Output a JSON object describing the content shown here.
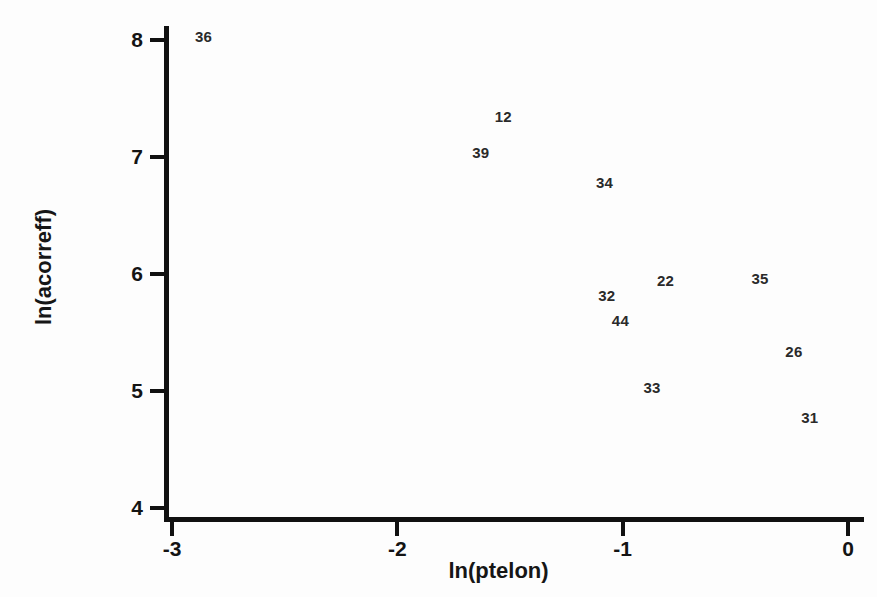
{
  "chart_data": {
    "type": "scatter",
    "title": "",
    "xlabel": "ln(ptelon)",
    "ylabel": "ln(acorreff)",
    "xlim": [
      -3.2,
      0.15
    ],
    "ylim": [
      3.9,
      8.15
    ],
    "xticks": [
      -3,
      -2,
      -1,
      0
    ],
    "xtick_labels": [
      "-3",
      "-2",
      "-1",
      "0"
    ],
    "yticks": [
      4,
      5,
      6,
      7,
      8
    ],
    "ytick_labels": [
      "4",
      "5",
      "6",
      "7",
      "8"
    ],
    "grid": false,
    "legend": false,
    "marker_style": "text-label-only",
    "points": [
      {
        "label": "36",
        "x": -2.86,
        "y": 8.03
      },
      {
        "label": "12",
        "x": -1.53,
        "y": 7.35
      },
      {
        "label": "39",
        "x": -1.63,
        "y": 7.04
      },
      {
        "label": "34",
        "x": -1.08,
        "y": 6.79
      },
      {
        "label": "22",
        "x": -0.81,
        "y": 5.95
      },
      {
        "label": "35",
        "x": -0.39,
        "y": 5.97
      },
      {
        "label": "32",
        "x": -1.07,
        "y": 5.82
      },
      {
        "label": "44",
        "x": -1.01,
        "y": 5.61
      },
      {
        "label": "26",
        "x": -0.24,
        "y": 5.34
      },
      {
        "label": "33",
        "x": -0.87,
        "y": 5.03
      },
      {
        "label": "31",
        "x": -0.17,
        "y": 4.78
      }
    ]
  },
  "colors": {
    "axis": "#111111",
    "label_text": "#2a2a2a",
    "tick_text": "#141414",
    "background": "#fdfdfd"
  }
}
